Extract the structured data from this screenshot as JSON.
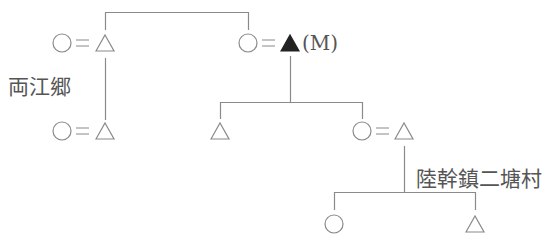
{
  "diagram": {
    "type": "kinship-chart",
    "colors": {
      "line": "#8a8a8a",
      "symbol": "#8a8a8a",
      "filled_symbol": "#222222",
      "text": "#555555"
    },
    "legend_symbols": {
      "circle": "female",
      "triangle": "male",
      "filled_triangle": "ego/subject",
      "equals": "marriage"
    },
    "labels": {
      "subject": "(M)",
      "place_left": "両江郷",
      "place_right": "陸幹鎮二塘村"
    },
    "nodes": [
      {
        "id": "g1-couple-left",
        "members": [
          "circle",
          "triangle"
        ],
        "row": 1
      },
      {
        "id": "g1-couple-right",
        "members": [
          "circle",
          "filled-triangle"
        ],
        "row": 1,
        "label": "(M)"
      },
      {
        "id": "g2-couple-left",
        "members": [
          "circle",
          "triangle"
        ],
        "row": 2
      },
      {
        "id": "g2-child-male",
        "members": [
          "triangle"
        ],
        "row": 2
      },
      {
        "id": "g2-couple-right",
        "members": [
          "circle",
          "triangle"
        ],
        "row": 2
      },
      {
        "id": "g3-child-female",
        "members": [
          "circle"
        ],
        "row": 3
      },
      {
        "id": "g3-child-male",
        "members": [
          "triangle"
        ],
        "row": 3
      }
    ]
  }
}
